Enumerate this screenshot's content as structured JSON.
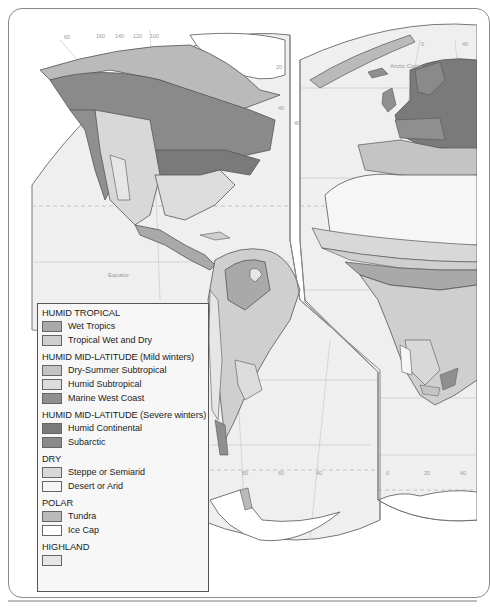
{
  "map": {
    "title": "World Climate Regions",
    "labels": {
      "arctic_circle": "Arctic Circle",
      "equator": "Equator",
      "lon_top_left": [
        "60",
        "160",
        "140",
        "120",
        "100"
      ],
      "lon_top_right": [
        "0",
        "40"
      ],
      "lat_left": [
        "20",
        "40"
      ],
      "lat_right": [
        "40"
      ],
      "lon_bottom_left": [
        "80",
        "60",
        "40"
      ],
      "lon_bottom_right": [
        "0",
        "20",
        "40"
      ]
    },
    "colors": {
      "ocean": "#efefef",
      "wet_tropics": "#a9a9a9",
      "tropical_wet_dry": "#cfcfcf",
      "dry_summer_subtropical": "#c4c4c4",
      "humid_subtropical": "#dcdcdc",
      "marine_west_coast": "#8f8f8f",
      "humid_continental": "#7a7a7a",
      "subarctic": "#8a8a8a",
      "steppe": "#d8d8d8",
      "desert": "#f6f6f6",
      "tundra": "#bababa",
      "ice_cap": "#ffffff",
      "highland": "#e6e6e6"
    }
  },
  "legend": {
    "groups": [
      {
        "heading": "HUMID TROPICAL",
        "items": [
          {
            "label": "Wet Tropics",
            "color": "#a9a9a9"
          },
          {
            "label": "Tropical Wet and Dry",
            "color": "#cfcfcf"
          }
        ]
      },
      {
        "heading": "HUMID MID-LATITUDE (Mild winters)",
        "items": [
          {
            "label": "Dry-Summer Subtropical",
            "color": "#c4c4c4"
          },
          {
            "label": "Humid Subtropical",
            "color": "#dcdcdc"
          },
          {
            "label": "Marine West Coast",
            "color": "#8f8f8f"
          }
        ]
      },
      {
        "heading": "HUMID MID-LATITUDE (Severe winters)",
        "items": [
          {
            "label": "Humid Continental",
            "color": "#7a7a7a"
          },
          {
            "label": "Subarctic",
            "color": "#8a8a8a"
          }
        ]
      },
      {
        "heading": "DRY",
        "items": [
          {
            "label": "Steppe or Semiarid",
            "color": "#d8d8d8"
          },
          {
            "label": "Desert or Arid",
            "color": "#f6f6f6"
          }
        ]
      },
      {
        "heading": "POLAR",
        "items": [
          {
            "label": "Tundra",
            "color": "#bababa"
          },
          {
            "label": "Ice Cap",
            "color": "#ffffff"
          }
        ]
      },
      {
        "heading": "HIGHLAND",
        "items": [
          {
            "label": "",
            "color": "#e6e6e6"
          }
        ]
      }
    ]
  }
}
